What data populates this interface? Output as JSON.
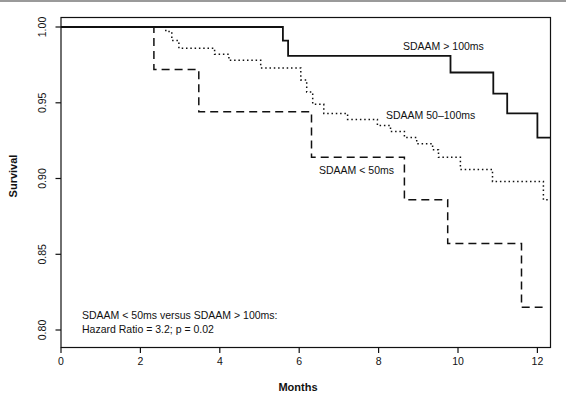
{
  "chart_data": {
    "type": "line",
    "subtype": "kaplan-meier-step",
    "title": "",
    "xlabel": "Months",
    "ylabel": "Survival",
    "xlim": [
      0,
      12.33
    ],
    "ylim": [
      0.788,
      1.006
    ],
    "grid": false,
    "legend_position": "inline-labels",
    "x_ticks": [
      0,
      2,
      4,
      6,
      8,
      10,
      12
    ],
    "x_tick_labels": [
      "0",
      "2",
      "4",
      "6",
      "8",
      "10",
      "12"
    ],
    "y_ticks": [
      1.0,
      0.95,
      0.9,
      0.85,
      0.8
    ],
    "y_tick_labels": [
      "1.00",
      "0.95",
      "0.90",
      "0.85",
      "0.80"
    ],
    "series": [
      {
        "id": "sdaam-gt-100ms",
        "name": "SDAAM > 100ms",
        "style": "solid",
        "end_month": 12.33,
        "points": [
          [
            0,
            1.0
          ],
          [
            5.59,
            0.991
          ],
          [
            5.72,
            0.981
          ],
          [
            9.81,
            0.97
          ],
          [
            10.89,
            0.956
          ],
          [
            11.24,
            0.943
          ],
          [
            12.0,
            0.927
          ]
        ]
      },
      {
        "id": "sdaam-50-100ms",
        "name": "SDAAM 50–100ms",
        "style": "dotted",
        "end_month": 12.33,
        "points": [
          [
            0,
            1.0
          ],
          [
            2.64,
            0.997
          ],
          [
            2.79,
            0.991
          ],
          [
            2.97,
            0.986
          ],
          [
            3.87,
            0.982
          ],
          [
            4.23,
            0.978
          ],
          [
            5.03,
            0.973
          ],
          [
            6.04,
            0.965
          ],
          [
            6.19,
            0.957
          ],
          [
            6.34,
            0.949
          ],
          [
            6.62,
            0.943
          ],
          [
            7.22,
            0.939
          ],
          [
            7.97,
            0.935
          ],
          [
            8.3,
            0.931
          ],
          [
            8.65,
            0.927
          ],
          [
            8.96,
            0.923
          ],
          [
            9.36,
            0.919
          ],
          [
            9.51,
            0.914
          ],
          [
            10.06,
            0.906
          ],
          [
            10.87,
            0.898
          ],
          [
            12.15,
            0.886
          ]
        ]
      },
      {
        "id": "sdaam-lt-50ms",
        "name": "SDAAM < 50ms",
        "style": "dashed",
        "end_month": 12.13,
        "points": [
          [
            0,
            1.0
          ],
          [
            2.34,
            0.972
          ],
          [
            3.47,
            0.944
          ],
          [
            6.31,
            0.914
          ],
          [
            8.65,
            0.886
          ],
          [
            9.74,
            0.857
          ],
          [
            11.6,
            0.815
          ]
        ]
      }
    ],
    "annotation": {
      "line1": "SDAAM < 50ms versus SDAAM > 100ms:",
      "line2": "Hazard Ratio = 3.2; p = 0.02"
    }
  }
}
